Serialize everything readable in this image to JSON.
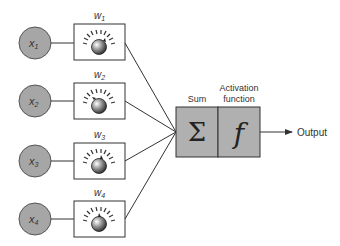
{
  "diagram": {
    "inputs": [
      {
        "label": "x",
        "sub": "1",
        "weight": "w",
        "wsub": "1"
      },
      {
        "label": "x",
        "sub": "2",
        "weight": "w",
        "wsub": "2"
      },
      {
        "label": "x",
        "sub": "3",
        "weight": "w",
        "wsub": "3"
      },
      {
        "label": "x",
        "sub": "4",
        "weight": "w",
        "wsub": "4"
      }
    ],
    "sum": {
      "caption": "Sum",
      "symbol": "Σ"
    },
    "activation": {
      "caption_line1": "Activation",
      "caption_line2": "function",
      "symbol": "f"
    },
    "output": {
      "label": "Output"
    },
    "colors": {
      "node_fill": "#a6a6a6",
      "node_stroke": "#555555",
      "box_fill": "#b0b0b0",
      "line": "#333333"
    }
  }
}
